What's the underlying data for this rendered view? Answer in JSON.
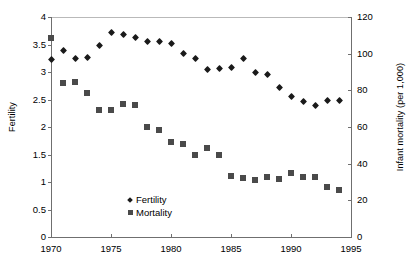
{
  "chart_data": {
    "type": "scatter",
    "title": "",
    "xlabel": "",
    "ylabel": "Fertility",
    "y2label": "Infant mortality (per 1,000)",
    "grid": false,
    "legend_position": "inside-lower-left",
    "xlim": [
      1970,
      1995
    ],
    "ylim": [
      0,
      4
    ],
    "y2lim": [
      0,
      120
    ],
    "xticks": [
      "1970",
      "1975",
      "1980",
      "1985",
      "1990",
      "1995"
    ],
    "yticks": [
      "0",
      "0.5",
      "1",
      "1.5",
      "2",
      "2.5",
      "3",
      "3.5",
      "4"
    ],
    "y2ticks": [
      "0",
      "20",
      "40",
      "60",
      "80",
      "100",
      "120"
    ],
    "x": [
      1970,
      1971,
      1972,
      1973,
      1974,
      1975,
      1976,
      1977,
      1978,
      1979,
      1980,
      1981,
      1982,
      1983,
      1984,
      1985,
      1986,
      1987,
      1988,
      1989,
      1990,
      1991,
      1992,
      1993,
      1994
    ],
    "series": [
      {
        "name": "Fertility",
        "axis": "left",
        "marker": "diamond",
        "color": "#1a1a1a",
        "values": [
          3.23,
          3.39,
          3.25,
          3.26,
          3.49,
          3.71,
          3.69,
          3.62,
          3.55,
          3.56,
          3.51,
          3.33,
          3.25,
          3.05,
          3.07,
          3.09,
          3.24,
          2.99,
          2.96,
          2.71,
          2.55,
          2.47,
          2.39,
          2.48,
          2.48
        ]
      },
      {
        "name": "Mortality",
        "axis": "right",
        "marker": "square",
        "color": "#4a4a4a",
        "values": [
          108.5,
          84.0,
          84.5,
          78.5,
          69.5,
          69.5,
          72.5,
          72.0,
          60.0,
          58.5,
          52.0,
          51.0,
          45.0,
          48.5,
          44.5,
          33.5,
          32.0,
          31.0,
          32.5,
          31.5,
          35.0,
          32.5,
          32.5,
          27.5,
          25.5
        ]
      }
    ]
  }
}
